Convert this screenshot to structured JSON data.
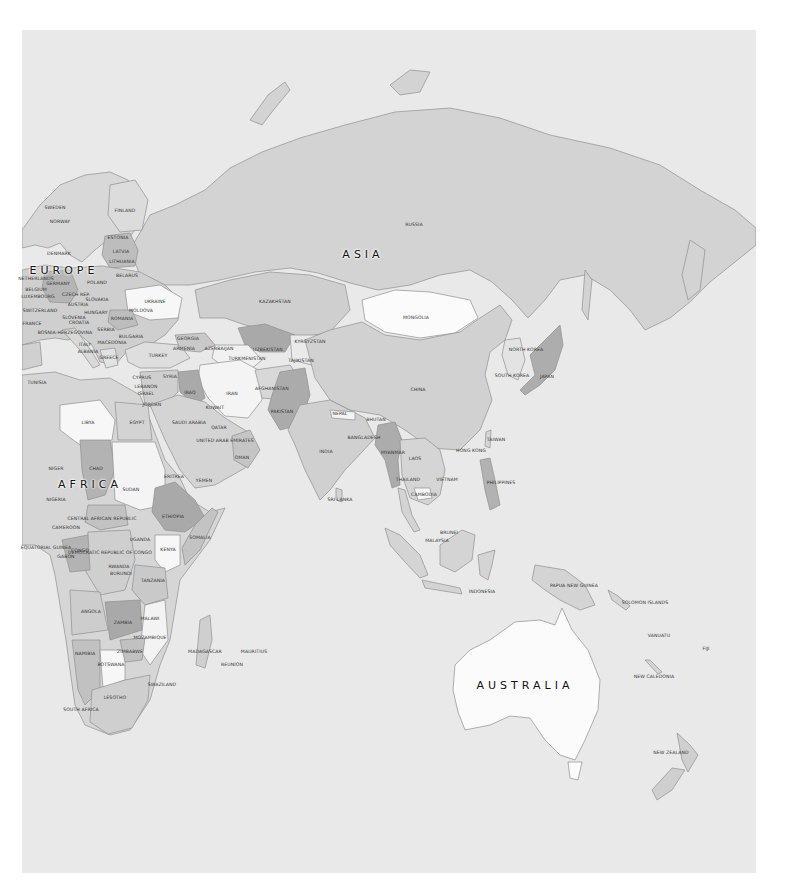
{
  "colors": {
    "ocean": "#e9e9e9",
    "shade_lightest": "#fbfbfb",
    "shade_light": "#dcdcdc",
    "shade_mid": "#cfcfcf",
    "shade_dark": "#bdbdbd",
    "shade_darkest": "#a9a9a9",
    "border": "#8f8f8f"
  },
  "continents": [
    {
      "id": "asia",
      "label": "ASIA",
      "x": 363,
      "y": 254
    },
    {
      "id": "europe",
      "label": "EUROPE",
      "x": 64,
      "y": 270
    },
    {
      "id": "africa",
      "label": "AFRICA",
      "x": 90,
      "y": 484
    },
    {
      "id": "australia",
      "label": "AUSTRALIA",
      "x": 525,
      "y": 685
    }
  ],
  "countries": [
    {
      "label": "RUSSIA",
      "x": 414,
      "y": 225
    },
    {
      "label": "SWEDEN",
      "x": 55,
      "y": 208
    },
    {
      "label": "FINLAND",
      "x": 125,
      "y": 211
    },
    {
      "label": "NORWAY",
      "x": 60,
      "y": 222
    },
    {
      "label": "ESTONIA",
      "x": 118,
      "y": 238
    },
    {
      "label": "LATVIA",
      "x": 121,
      "y": 252
    },
    {
      "label": "LITHUANIA",
      "x": 122,
      "y": 262
    },
    {
      "label": "DENMARK",
      "x": 59,
      "y": 254
    },
    {
      "label": "BELARUS",
      "x": 127,
      "y": 276
    },
    {
      "label": "NETHERLANDS",
      "x": 36,
      "y": 279
    },
    {
      "label": "GERMANY",
      "x": 58,
      "y": 284
    },
    {
      "label": "POLAND",
      "x": 97,
      "y": 283
    },
    {
      "label": "BELGIUM",
      "x": 36,
      "y": 290
    },
    {
      "label": "CZECH REP.",
      "x": 76,
      "y": 295
    },
    {
      "label": "LUXEMBOURG",
      "x": 38,
      "y": 297
    },
    {
      "label": "SLOVAKIA",
      "x": 97,
      "y": 300
    },
    {
      "label": "UKRAINE",
      "x": 155,
      "y": 302
    },
    {
      "label": "AUSTRIA",
      "x": 78,
      "y": 305
    },
    {
      "label": "SWITZERLAND",
      "x": 40,
      "y": 311
    },
    {
      "label": "HUNGARY",
      "x": 96,
      "y": 313
    },
    {
      "label": "MOLDOVA",
      "x": 141,
      "y": 311
    },
    {
      "label": "FRANCE",
      "x": 32,
      "y": 324
    },
    {
      "label": "SLOVENIA",
      "x": 74,
      "y": 318
    },
    {
      "label": "CROATIA",
      "x": 79,
      "y": 323
    },
    {
      "label": "ROMANIA",
      "x": 122,
      "y": 319
    },
    {
      "label": "SERBIA",
      "x": 106,
      "y": 330
    },
    {
      "label": "BOSNIA-HERZEGOVINA",
      "x": 65,
      "y": 333
    },
    {
      "label": "BULGARIA",
      "x": 131,
      "y": 337
    },
    {
      "label": "ITALY",
      "x": 85,
      "y": 345
    },
    {
      "label": "MACEDONIA",
      "x": 112,
      "y": 343
    },
    {
      "label": "ALBANIA",
      "x": 88,
      "y": 352
    },
    {
      "label": "GREECE",
      "x": 109,
      "y": 358
    },
    {
      "label": "GEORGIA",
      "x": 188,
      "y": 339
    },
    {
      "label": "ARMENIA",
      "x": 184,
      "y": 349
    },
    {
      "label": "AZERBAIJAN",
      "x": 219,
      "y": 349
    },
    {
      "label": "TURKEY",
      "x": 158,
      "y": 356
    },
    {
      "label": "KAZAKHSTAN",
      "x": 275,
      "y": 302
    },
    {
      "label": "UZBEKISTAN",
      "x": 268,
      "y": 350
    },
    {
      "label": "KYRGYZSTAN",
      "x": 310,
      "y": 342
    },
    {
      "label": "TURKMENISTAN",
      "x": 247,
      "y": 359
    },
    {
      "label": "TAJIKISTAN",
      "x": 301,
      "y": 361
    },
    {
      "label": "MONGOLIA",
      "x": 416,
      "y": 318
    },
    {
      "label": "TUNISIA",
      "x": 37,
      "y": 383
    },
    {
      "label": "CYPRUS",
      "x": 142,
      "y": 378
    },
    {
      "label": "SYRIA",
      "x": 170,
      "y": 377
    },
    {
      "label": "LEBANON",
      "x": 146,
      "y": 387
    },
    {
      "label": "ISRAEL",
      "x": 146,
      "y": 394
    },
    {
      "label": "IRAQ",
      "x": 190,
      "y": 393
    },
    {
      "label": "IRAN",
      "x": 232,
      "y": 394
    },
    {
      "label": "AFGHANISTAN",
      "x": 272,
      "y": 389
    },
    {
      "label": "JORDAN",
      "x": 152,
      "y": 405
    },
    {
      "label": "KUWAIT",
      "x": 215,
      "y": 408
    },
    {
      "label": "PAKISTAN",
      "x": 282,
      "y": 412
    },
    {
      "label": "CHINA",
      "x": 418,
      "y": 390
    },
    {
      "label": "NORTH KOREA",
      "x": 526,
      "y": 350
    },
    {
      "label": "SOUTH KOREA",
      "x": 512,
      "y": 376
    },
    {
      "label": "JAPAN",
      "x": 547,
      "y": 377
    },
    {
      "label": "LIBYA",
      "x": 88,
      "y": 423
    },
    {
      "label": "EGYPT",
      "x": 137,
      "y": 423
    },
    {
      "label": "SAUDI ARABIA",
      "x": 189,
      "y": 423
    },
    {
      "label": "QATAR",
      "x": 219,
      "y": 428
    },
    {
      "label": "UNITED ARAB EMIRATES",
      "x": 225,
      "y": 441
    },
    {
      "label": "NEPAL",
      "x": 340,
      "y": 414
    },
    {
      "label": "BHUTAN",
      "x": 376,
      "y": 420
    },
    {
      "label": "BANGLADESH",
      "x": 364,
      "y": 438
    },
    {
      "label": "INDIA",
      "x": 326,
      "y": 452
    },
    {
      "label": "TAIWAN",
      "x": 496,
      "y": 440
    },
    {
      "label": "HONG KONG",
      "x": 471,
      "y": 451
    },
    {
      "label": "MYANMAR",
      "x": 393,
      "y": 453
    },
    {
      "label": "LAOS",
      "x": 415,
      "y": 459
    },
    {
      "label": "OMAN",
      "x": 242,
      "y": 458
    },
    {
      "label": "NIGER",
      "x": 56,
      "y": 469
    },
    {
      "label": "CHAD",
      "x": 96,
      "y": 469
    },
    {
      "label": "SUDAN",
      "x": 131,
      "y": 490
    },
    {
      "label": "ERITREA",
      "x": 174,
      "y": 477
    },
    {
      "label": "YEMEN",
      "x": 204,
      "y": 481
    },
    {
      "label": "THAILAND",
      "x": 408,
      "y": 480
    },
    {
      "label": "VIETNAM",
      "x": 447,
      "y": 480
    },
    {
      "label": "PHILIPPINES",
      "x": 501,
      "y": 483
    },
    {
      "label": "CAMBODIA",
      "x": 424,
      "y": 495
    },
    {
      "label": "NIGERIA",
      "x": 56,
      "y": 500
    },
    {
      "label": "ETHIOPIA",
      "x": 173,
      "y": 517
    },
    {
      "label": "CENTRAL AFRICAN REPUBLIC",
      "x": 102,
      "y": 519
    },
    {
      "label": "SRI LANKA",
      "x": 340,
      "y": 500
    },
    {
      "label": "CAMEROON",
      "x": 66,
      "y": 528
    },
    {
      "label": "SOMALIA",
      "x": 200,
      "y": 538
    },
    {
      "label": "UGANDA",
      "x": 140,
      "y": 540
    },
    {
      "label": "BRUNEI",
      "x": 449,
      "y": 533
    },
    {
      "label": "MALAYSIA",
      "x": 437,
      "y": 541
    },
    {
      "label": "EQUATORIAL GUINEA",
      "x": 46,
      "y": 548
    },
    {
      "label": "CONGO",
      "x": 80,
      "y": 551
    },
    {
      "label": "DEMOCRATIC REPUBLIC OF CONGO",
      "x": 110,
      "y": 553
    },
    {
      "label": "KENYA",
      "x": 168,
      "y": 550
    },
    {
      "label": "GABON",
      "x": 66,
      "y": 557
    },
    {
      "label": "RWANDA",
      "x": 119,
      "y": 567
    },
    {
      "label": "BURUNDI",
      "x": 121,
      "y": 574
    },
    {
      "label": "TANZANIA",
      "x": 153,
      "y": 581
    },
    {
      "label": "INDONESIA",
      "x": 482,
      "y": 592
    },
    {
      "label": "PAPUA NEW GUINEA",
      "x": 574,
      "y": 586
    },
    {
      "label": "SOLOMON ISLANDS",
      "x": 645,
      "y": 603
    },
    {
      "label": "ANGOLA",
      "x": 91,
      "y": 612
    },
    {
      "label": "ZAMBIA",
      "x": 123,
      "y": 623
    },
    {
      "label": "MALAWI",
      "x": 150,
      "y": 619
    },
    {
      "label": "MOZAMBIQUE",
      "x": 150,
      "y": 638
    },
    {
      "label": "VANUATU",
      "x": 659,
      "y": 636
    },
    {
      "label": "FIJI",
      "x": 706,
      "y": 649
    },
    {
      "label": "NAMIBIA",
      "x": 85,
      "y": 654
    },
    {
      "label": "ZIMBABWE",
      "x": 130,
      "y": 652
    },
    {
      "label": "MADAGASCAR",
      "x": 205,
      "y": 652
    },
    {
      "label": "MAURITIUS",
      "x": 254,
      "y": 652
    },
    {
      "label": "REUNION",
      "x": 232,
      "y": 665
    },
    {
      "label": "NEW CALEDONIA",
      "x": 654,
      "y": 677
    },
    {
      "label": "BOTSWANA",
      "x": 111,
      "y": 665
    },
    {
      "label": "SWAZILAND",
      "x": 162,
      "y": 685
    },
    {
      "label": "LESOTHO",
      "x": 115,
      "y": 698
    },
    {
      "label": "SOUTH AFRICA",
      "x": 81,
      "y": 710
    },
    {
      "label": "NEW ZEALAND",
      "x": 671,
      "y": 753
    }
  ]
}
